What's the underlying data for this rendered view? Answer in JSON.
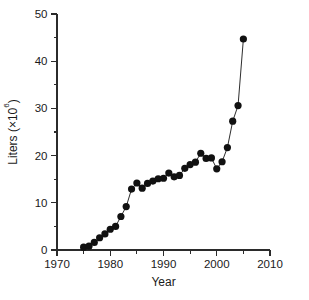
{
  "chart_data": {
    "type": "line",
    "title": "",
    "subtitle": "",
    "xlabel": "Year",
    "ylabel": "Liters (×10⁶)",
    "ylabel_base": "Liters (×10",
    "ylabel_exponent": "6",
    "ylabel_close": ")",
    "xlim": [
      1970,
      2010
    ],
    "ylim": [
      0,
      50
    ],
    "xticks": [
      1970,
      1980,
      1990,
      2000,
      2010
    ],
    "xtick_labels": [
      "1970",
      "1980",
      "1990",
      "2000",
      "2010"
    ],
    "xminor_ticks": [
      1975,
      1985,
      1995,
      2005
    ],
    "yticks": [
      0,
      10,
      20,
      30,
      40,
      50
    ],
    "ytick_labels": [
      "0",
      "10",
      "20",
      "30",
      "40",
      "50"
    ],
    "yminor_ticks": [
      5,
      15,
      25,
      35,
      45
    ],
    "grid": false,
    "legend": null,
    "marker": "filled-circle",
    "marker_color": "#111111",
    "line_color": "#151515",
    "background_color": "#ffffff",
    "x": [
      1975,
      1976,
      1977,
      1978,
      1979,
      1980,
      1981,
      1982,
      1983,
      1984,
      1985,
      1986,
      1987,
      1988,
      1989,
      1990,
      1991,
      1992,
      1993,
      1994,
      1995,
      1996,
      1997,
      1998,
      1999,
      2000,
      2001,
      2002,
      2003,
      2004,
      2005
    ],
    "values": [
      0.6,
      0.8,
      1.6,
      2.6,
      3.4,
      4.4,
      5.0,
      7.1,
      9.2,
      12.9,
      14.2,
      13.1,
      14.1,
      14.6,
      15.1,
      15.2,
      16.3,
      15.5,
      15.8,
      17.3,
      18.1,
      18.6,
      20.5,
      19.4,
      19.5,
      17.2,
      18.7,
      21.7,
      27.3,
      30.6,
      44.7
    ],
    "series": [
      {
        "name": "Liters",
        "values": [
          0.6,
          0.8,
          1.6,
          2.6,
          3.4,
          4.4,
          5.0,
          7.1,
          9.2,
          12.9,
          14.2,
          13.1,
          14.1,
          14.6,
          15.1,
          15.2,
          16.3,
          15.5,
          15.8,
          17.3,
          18.1,
          18.6,
          20.5,
          19.4,
          19.5,
          17.2,
          18.7,
          21.7,
          27.3,
          30.6,
          44.7
        ]
      }
    ],
    "annotations": []
  }
}
